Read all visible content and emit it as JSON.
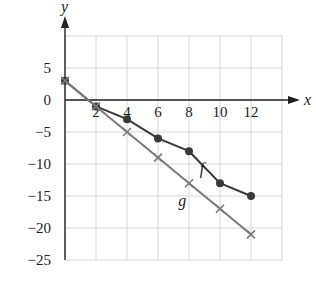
{
  "chart_data": {
    "type": "line",
    "title": "",
    "xlabel": "x",
    "ylabel": "y",
    "xlim": [
      0,
      14
    ],
    "ylim": [
      -25,
      10
    ],
    "grid": true,
    "x_ticks": [
      2,
      4,
      6,
      8,
      10,
      12
    ],
    "y_ticks": [
      5,
      0,
      -5,
      -10,
      -15,
      -20,
      -25
    ],
    "x": [
      0,
      2,
      4,
      6,
      8,
      10,
      12
    ],
    "series": [
      {
        "name": "f",
        "marker": "dot",
        "color": "#3a3a3a",
        "values": [
          3,
          -1,
          -3,
          -6,
          -8,
          -13,
          -15
        ],
        "label_at": [
          8.7,
          -11.5
        ]
      },
      {
        "name": "g",
        "marker": "x",
        "color": "#7a7a7a",
        "values": [
          3,
          -1,
          -5,
          -9,
          -13,
          -17,
          -21
        ],
        "label_at": [
          7.3,
          -16.5
        ]
      }
    ]
  }
}
